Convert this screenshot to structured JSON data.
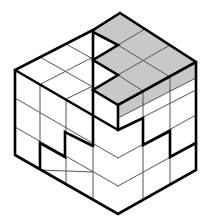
{
  "figure": {
    "title": "Isometric cube puzzle",
    "grid": {
      "left_face_columns": 4,
      "right_face_columns": 3,
      "rows": 4
    },
    "colors": {
      "outline": "#000000",
      "grid_line": "#555555",
      "shaded_piece": "#c8c8c8",
      "face": "#ffffff"
    }
  }
}
